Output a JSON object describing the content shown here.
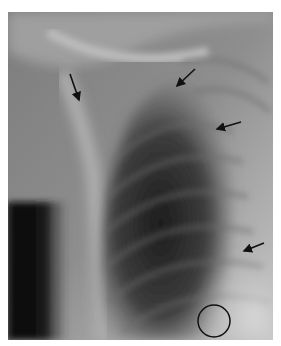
{
  "figure": {
    "type": "radiograph",
    "frame": {
      "x": 8,
      "y": 12,
      "width": 265,
      "height": 328
    }
  },
  "annotations": {
    "arrows": [
      {
        "id": "arrow-1",
        "x1": 70,
        "y1": 74,
        "x2": 79,
        "y2": 100
      },
      {
        "id": "arrow-2",
        "x1": 195,
        "y1": 69,
        "x2": 177,
        "y2": 86
      },
      {
        "id": "arrow-3",
        "x1": 241,
        "y1": 122,
        "x2": 217,
        "y2": 129
      },
      {
        "id": "arrow-4",
        "x1": 264,
        "y1": 243,
        "x2": 244,
        "y2": 251
      }
    ],
    "circle": {
      "cx": 214,
      "cy": 321,
      "r": 16
    },
    "color": "#111111"
  }
}
